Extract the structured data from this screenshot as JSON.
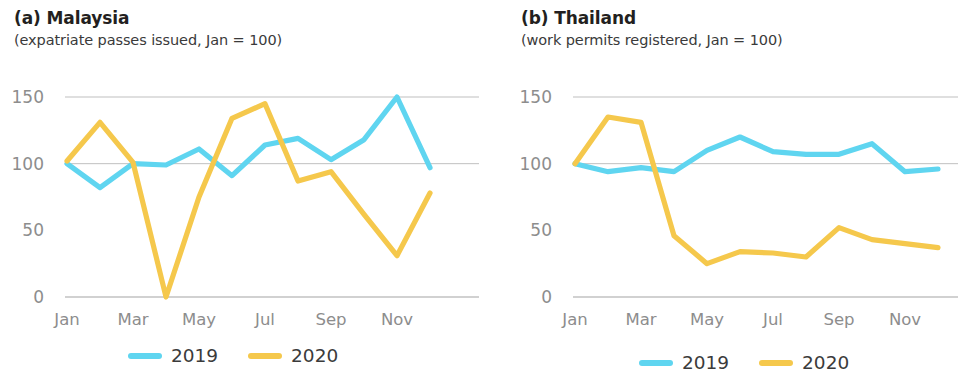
{
  "figure": {
    "panels": [
      {
        "key": "malaysia",
        "label": "(a) Malaysia",
        "subtitle": "(expatriate passes issued, Jan = 100)"
      },
      {
        "key": "thailand",
        "label": "(b) Thailand",
        "subtitle": "(work permits registered, Jan = 100)"
      }
    ]
  },
  "legend": {
    "items": [
      {
        "name": "2019",
        "color": "#5fd5f0"
      },
      {
        "name": "2020",
        "color": "#f5c84c"
      }
    ]
  },
  "colors": {
    "series_2019": "#5fd5f0",
    "series_2020": "#f5c84c",
    "gridline": "#9b9b9b",
    "tick_text": "#8d8d8d",
    "title_text": "#231f20"
  },
  "chart_data": [
    {
      "type": "line",
      "title": "(a) Malaysia",
      "subtitle": "(expatriate passes issued, Jan = 100)",
      "xlabel": "",
      "ylabel": "",
      "grid": true,
      "legend_position": "bottom",
      "ylim": [
        0,
        150
      ],
      "yticks": [
        0,
        50,
        100,
        150
      ],
      "categories": [
        "Jan",
        "Feb",
        "Mar",
        "Apr",
        "May",
        "Jun",
        "Jul",
        "Aug",
        "Sep",
        "Oct",
        "Nov",
        "Dec"
      ],
      "xtick_labels": [
        "Jan",
        "Mar",
        "May",
        "Jul",
        "Sep",
        "Nov"
      ],
      "series": [
        {
          "name": "2019",
          "color": "#5fd5f0",
          "values": [
            100,
            82,
            100,
            99,
            111,
            91,
            114,
            119,
            103,
            118,
            150,
            97
          ]
        },
        {
          "name": "2020",
          "color": "#f5c84c",
          "values": [
            102,
            131,
            101,
            0,
            75,
            134,
            145,
            87,
            94,
            62,
            31,
            78
          ]
        }
      ]
    },
    {
      "type": "line",
      "title": "(b) Thailand",
      "subtitle": "(work permits registered, Jan = 100)",
      "xlabel": "",
      "ylabel": "",
      "grid": true,
      "legend_position": "bottom",
      "ylim": [
        0,
        150
      ],
      "yticks": [
        0,
        50,
        100,
        150
      ],
      "categories": [
        "Jan",
        "Feb",
        "Mar",
        "Apr",
        "May",
        "Jun",
        "Jul",
        "Aug",
        "Sep",
        "Oct",
        "Nov",
        "Dec"
      ],
      "xtick_labels": [
        "Jan",
        "Mar",
        "May",
        "Jul",
        "Sep",
        "Nov"
      ],
      "series": [
        {
          "name": "2019",
          "color": "#5fd5f0",
          "values": [
            100,
            94,
            97,
            94,
            110,
            120,
            109,
            107,
            107,
            115,
            94,
            96
          ]
        },
        {
          "name": "2020",
          "color": "#f5c84c",
          "values": [
            100,
            135,
            131,
            46,
            25,
            34,
            33,
            30,
            52,
            43,
            40,
            37
          ]
        }
      ]
    }
  ]
}
